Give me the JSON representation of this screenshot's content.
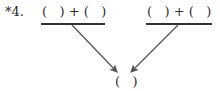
{
  "problem": {
    "label": "*4.",
    "left_expression": "(   ) + (   )",
    "right_expression": "(   ) + (   )",
    "result": "(   )"
  },
  "colors": {
    "text": "#2a2a2a",
    "arrow": "#555555"
  }
}
